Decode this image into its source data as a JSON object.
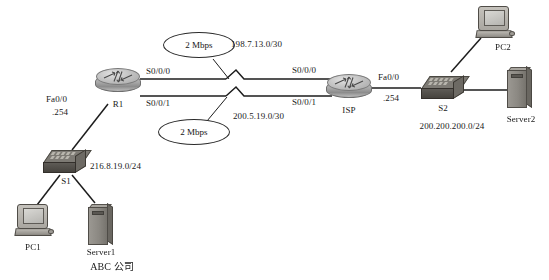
{
  "diagram": {
    "caption": "ABC 公司",
    "link_color": "#1d1d1d",
    "background": "#ffffff"
  },
  "devices": {
    "r1": {
      "label": "R1",
      "type": "router"
    },
    "isp": {
      "label": "ISP",
      "type": "router"
    },
    "s1": {
      "label": "S1",
      "type": "switch"
    },
    "s2": {
      "label": "S2",
      "type": "switch"
    },
    "pc1": {
      "label": "PC1",
      "type": "pc"
    },
    "pc2": {
      "label": "PC2",
      "type": "pc"
    },
    "server1": {
      "label": "Server1",
      "type": "server"
    },
    "server2": {
      "label": "Server2",
      "type": "server"
    }
  },
  "interfaces": {
    "r1_fa00": "Fa0/0",
    "r1_fa00_ip": ".254",
    "r1_s000": "S0/0/0",
    "r1_s001": "S0/0/1",
    "isp_s000": "S0/0/0",
    "isp_s001": "S0/0/1",
    "isp_fa00": "Fa0/0",
    "isp_fa00_ip": ".254"
  },
  "networks": {
    "lan_abc": "216.8.19.0/24",
    "wan_upper": "198.7.13.0/30",
    "wan_lower": "200.5.19.0/30",
    "lan_isp": "200.200.200.0/24"
  },
  "bandwidth": {
    "upper": "2 Mbps",
    "lower": "2 Mbps"
  }
}
